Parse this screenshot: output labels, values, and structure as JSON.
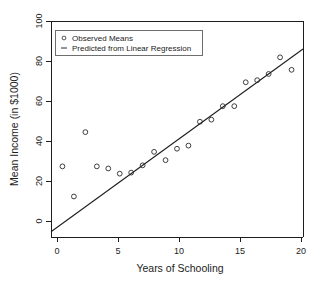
{
  "chart_data": {
    "type": "scatter",
    "title": "",
    "xlabel": "Years of Schooling",
    "ylabel": "Mean Income (in $1000)",
    "xlim": [
      -1,
      21
    ],
    "ylim": [
      -2,
      102
    ],
    "xticks": [
      0,
      5,
      10,
      15,
      20
    ],
    "xtick_labels": [
      "0",
      "5",
      "10",
      "15",
      "20"
    ],
    "yticks": [
      0,
      20,
      40,
      60,
      80,
      100
    ],
    "ytick_labels": [
      "0",
      "20",
      "40",
      "60",
      "80",
      "100"
    ],
    "grid": false,
    "legend_position": "top-left",
    "series": [
      {
        "name": "Observed Means",
        "type": "scatter",
        "marker": "open-circle",
        "color": "#2a2a2a",
        "x": [
          0,
          1,
          2,
          3,
          4,
          5,
          6,
          7,
          8,
          9,
          10,
          11,
          12,
          13,
          14,
          15,
          16,
          17,
          18,
          19,
          20
        ],
        "values": [
          32.0,
          17.5,
          48.5,
          32.0,
          31.0,
          28.5,
          29.0,
          32.5,
          39.0,
          35.0,
          40.5,
          42.0,
          53.5,
          54.5,
          61.0,
          61.0,
          72.5,
          73.5,
          76.5,
          84.5,
          78.5
        ]
      },
      {
        "name": "Predicted from Linear Regression",
        "type": "line",
        "color": "#1d1d1d",
        "x": [
          -1,
          21
        ],
        "values": [
          0.5,
          88.5
        ],
        "slope": 4.0,
        "intercept": 4.5
      }
    ],
    "legend_entries": [
      {
        "label": "Observed Means",
        "marker": "open-circle"
      },
      {
        "label": "Predicted from Linear Regression",
        "marker": "dash"
      }
    ]
  },
  "axes": {
    "x_title": "Years of Schooling",
    "y_title": "Mean Income (in $1000)"
  }
}
